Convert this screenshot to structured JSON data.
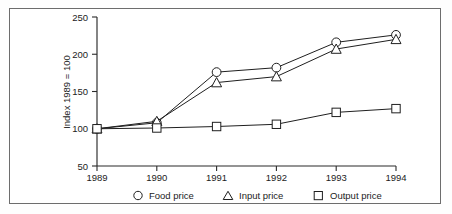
{
  "figure": {
    "frame_color": "#6d6d6d",
    "background": "#ffffff"
  },
  "axes": {
    "y_title": "Index 1989 = 100",
    "y_ticks": [
      "250",
      "200",
      "150",
      "100",
      "50"
    ],
    "x_ticks": [
      "1989",
      "1990",
      "1991",
      "1992",
      "1993",
      "1994"
    ]
  },
  "legend": {
    "entries": [
      {
        "label": "Food price",
        "marker": "circle-marker"
      },
      {
        "label": "Input price",
        "marker": "triangle-marker"
      },
      {
        "label": "Output price",
        "marker": "square-marker"
      }
    ]
  },
  "chart_data": {
    "type": "line",
    "title": "",
    "subtitle": "",
    "xlabel": "",
    "ylabel": "Index 1989 = 100",
    "x": [
      "1989",
      "1990",
      "1991",
      "1992",
      "1993",
      "1994"
    ],
    "categories": [
      "1989",
      "1990",
      "1991",
      "1992",
      "1993",
      "1994"
    ],
    "series": [
      {
        "name": "Food price",
        "marker": "circle",
        "values": [
          100,
          108,
          176,
          182,
          216,
          226
        ]
      },
      {
        "name": "Input price",
        "marker": "triangle",
        "values": [
          100,
          110,
          162,
          170,
          207,
          220
        ]
      },
      {
        "name": "Output price",
        "marker": "square",
        "values": [
          100,
          101,
          103,
          106,
          122,
          127
        ]
      }
    ],
    "ylim": [
      50,
      250
    ],
    "ytick_step": 50,
    "grid": false,
    "legend_position": "bottom",
    "line_color": "#1f1f1f",
    "marker_fill": "#ffffff"
  }
}
